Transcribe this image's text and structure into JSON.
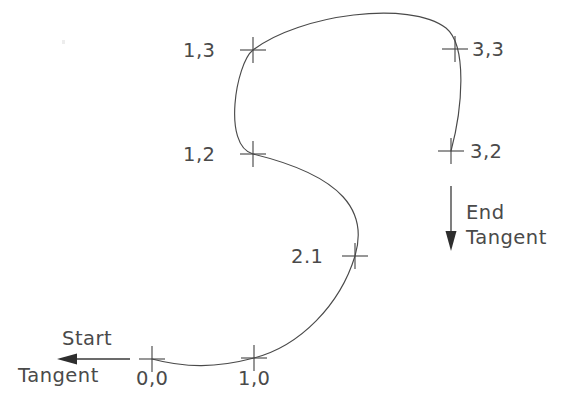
{
  "diagram": {
    "background_color": "#ffffff",
    "curve_color": "#4a4a4a",
    "text_color": "#4a4a4a",
    "arrow_color": "#2e2e2e"
  },
  "control_points": [
    {
      "label": "1,3",
      "x": 253,
      "y": 50,
      "label_x": 183,
      "label_y": 57,
      "label_anchor": "start"
    },
    {
      "label": "3,3",
      "x": 455,
      "y": 49,
      "label_x": 472,
      "label_y": 56,
      "label_anchor": "start"
    },
    {
      "label": "1,2",
      "x": 253,
      "y": 154,
      "label_x": 183,
      "label_y": 161,
      "label_anchor": "start"
    },
    {
      "label": "3,2",
      "x": 451,
      "y": 151,
      "label_x": 470,
      "label_y": 158,
      "label_anchor": "start"
    },
    {
      "label": "2.1",
      "x": 355,
      "y": 256,
      "label_x": 291,
      "label_y": 263,
      "label_anchor": "start"
    },
    {
      "label": "0,0",
      "x": 152,
      "y": 359,
      "label_x": 136,
      "label_y": 385,
      "label_anchor": "start"
    },
    {
      "label": "1,0",
      "x": 254,
      "y": 358,
      "label_x": 238,
      "label_y": 385,
      "label_anchor": "start"
    }
  ],
  "tangents": [
    {
      "name": "start-tangent",
      "label_line1": "Start",
      "label_line2": "Tangent",
      "direction": "left",
      "line_x1": 130,
      "line_y1": 359,
      "line_x2": 62,
      "line_y2": 359,
      "label1_x": 62,
      "label1_y": 345,
      "label2_x": 18,
      "label2_y": 382
    },
    {
      "name": "end-tangent",
      "label_line1": "End",
      "label_line2": "Tangent",
      "direction": "down",
      "line_x1": 451,
      "line_y1": 186,
      "line_x2": 451,
      "line_y2": 246,
      "label1_x": 466,
      "label1_y": 219,
      "label2_x": 466,
      "label2_y": 244
    }
  ],
  "curve": {
    "marker_arm_half_length": 13,
    "path": "M 152,359 C 186,368 216,368 254,358 C 300,346 340,305 355,256 C 368,212 344,176 253,154 C 222,146 236,63 253,50 C 300,14 410,0 446,28 C 468,46 462,110 451,151"
  },
  "specks": [
    {
      "x": 62,
      "y": 40,
      "w": 3,
      "h": 4
    }
  ]
}
